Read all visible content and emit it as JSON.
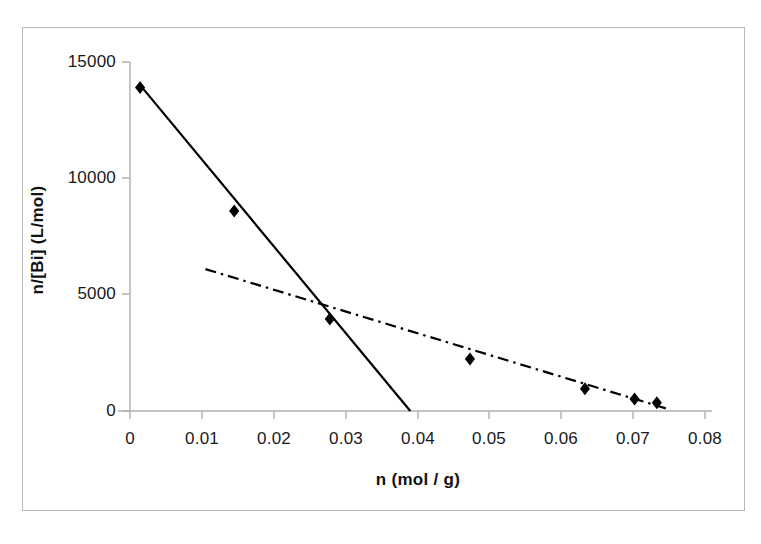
{
  "chart_data": {
    "type": "scatter",
    "title": "",
    "xlabel": "n (mol / g)",
    "ylabel": "n/[Bi] (L/mol)",
    "xlim": [
      0,
      0.08
    ],
    "ylim": [
      0,
      15000
    ],
    "grid": false,
    "legend": "none",
    "xticks": [
      "0",
      "0.01",
      "0.02",
      "0.03",
      "0.04",
      "0.05",
      "0.06",
      "0.07",
      "0.08"
    ],
    "xtick_values": [
      0,
      0.01,
      0.02,
      0.03,
      0.04,
      0.05,
      0.06,
      0.07,
      0.08
    ],
    "yticks": [
      "0",
      "5000",
      "10000",
      "15000"
    ],
    "ytick_values": [
      0,
      5000,
      10000,
      15000
    ],
    "marker": "filled-diamond",
    "marker_color": "#000000",
    "points": [
      {
        "x": 0.0014,
        "y": 13900
      },
      {
        "x": 0.0145,
        "y": 8600
      },
      {
        "x": 0.0278,
        "y": 3950
      },
      {
        "x": 0.0473,
        "y": 2230
      },
      {
        "x": 0.0633,
        "y": 960
      },
      {
        "x": 0.0702,
        "y": 520
      },
      {
        "x": 0.0733,
        "y": 350
      }
    ],
    "series": [
      {
        "name": "high-affinity-fit",
        "type": "line",
        "style": "solid",
        "color": "#000000",
        "x": [
          0.0013,
          0.039
        ],
        "values": [
          14050,
          0
        ]
      },
      {
        "name": "low-affinity-fit",
        "type": "line",
        "style": "dash-dot",
        "color": "#000000",
        "x": [
          0.0105,
          0.0748
        ],
        "values": [
          6100,
          90
        ]
      }
    ]
  },
  "caption": {
    "text": ""
  }
}
